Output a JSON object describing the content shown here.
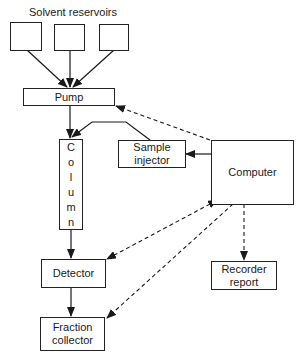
{
  "title": "Solvent reservoirs",
  "nodes": {
    "reservoir_1": "",
    "reservoir_2": "",
    "reservoir_3": "",
    "pump": "Pump",
    "column": [
      "C",
      "o",
      "l",
      "u",
      "m",
      "n"
    ],
    "sample_injector_line1": "Sample",
    "sample_injector_line2": "injector",
    "computer": "Computer",
    "detector": "Detector",
    "fraction_collector_line1": "Fraction",
    "fraction_collector_line2": "collector",
    "recorder_line1": "Recorder",
    "recorder_line2": "report"
  },
  "edges": [
    {
      "from": "reservoir_1",
      "to": "pump",
      "style": "solid"
    },
    {
      "from": "reservoir_2",
      "to": "pump",
      "style": "solid"
    },
    {
      "from": "reservoir_3",
      "to": "pump",
      "style": "solid"
    },
    {
      "from": "pump",
      "to": "column",
      "style": "solid"
    },
    {
      "from": "sample_injector",
      "to": "column",
      "style": "solid"
    },
    {
      "from": "computer",
      "to": "sample_injector",
      "style": "solid"
    },
    {
      "from": "computer",
      "to": "pump",
      "style": "dashed"
    },
    {
      "from": "column",
      "to": "detector",
      "style": "solid"
    },
    {
      "from": "computer",
      "to": "detector",
      "style": "dashed-bidirectional"
    },
    {
      "from": "computer",
      "to": "fraction_collector",
      "style": "dashed"
    },
    {
      "from": "computer",
      "to": "recorder_report",
      "style": "dashed"
    },
    {
      "from": "detector",
      "to": "fraction_collector",
      "style": "solid"
    }
  ]
}
